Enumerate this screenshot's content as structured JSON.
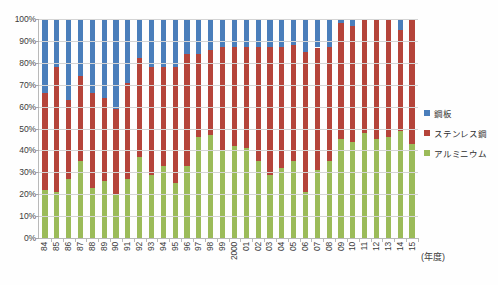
{
  "chart_data": {
    "type": "bar",
    "subtype": "100% stacked column",
    "title": "",
    "xlabel": "(年度)",
    "ylabel": "",
    "ylim": [
      0,
      100
    ],
    "ytick_labels": [
      "100%",
      "90%",
      "80%",
      "70%",
      "60%",
      "50%",
      "40%",
      "30%",
      "20%",
      "10%",
      "0%"
    ],
    "ytick_values": [
      100,
      90,
      80,
      70,
      60,
      50,
      40,
      30,
      20,
      10,
      0
    ],
    "grid": true,
    "legend_position": "right",
    "categories": [
      "84",
      "85",
      "86",
      "87",
      "88",
      "89",
      "90",
      "91",
      "92",
      "93",
      "94",
      "95",
      "96",
      "97",
      "98",
      "99",
      "2000",
      "01",
      "02",
      "03",
      "04",
      "05",
      "06",
      "07",
      "08",
      "09",
      "10",
      "11",
      "12",
      "13",
      "14",
      "15"
    ],
    "series": [
      {
        "name": "アルミニウム",
        "color": "#9BBB59",
        "values": [
          22,
          21,
          27,
          35,
          23,
          26,
          20,
          27,
          37,
          29,
          33,
          25,
          33,
          46,
          47,
          40,
          42,
          41,
          35,
          29,
          32,
          35,
          21,
          31,
          35,
          45,
          44,
          48,
          45,
          46,
          49,
          43
        ]
      },
      {
        "name": "ステンレス鋼",
        "color": "#B5443A",
        "values": [
          44,
          57,
          36,
          39,
          43,
          38,
          39,
          44,
          45,
          49,
          45,
          53,
          51,
          38,
          39,
          47,
          45,
          46,
          52,
          58,
          55,
          53,
          64,
          56,
          52,
          53,
          53,
          52,
          55,
          54,
          46,
          57
        ]
      },
      {
        "name": "鋼板",
        "color": "#4A7EBB",
        "values": [
          34,
          22,
          37,
          26,
          34,
          36,
          41,
          29,
          18,
          22,
          22,
          22,
          16,
          16,
          14,
          13,
          13,
          13,
          13,
          13,
          13,
          12,
          15,
          13,
          13,
          2,
          3,
          0,
          0,
          0,
          5,
          0
        ]
      }
    ],
    "stack_tops_alum": [
      22,
      21,
      27,
      35,
      23,
      26,
      20,
      27,
      37,
      29,
      33,
      25,
      33,
      46,
      47,
      40,
      42,
      41,
      35,
      29,
      32,
      35,
      21,
      31,
      35,
      45,
      44,
      48,
      45,
      46,
      49,
      43
    ],
    "stack_tops_stainless": [
      66,
      78,
      63,
      74,
      66,
      64,
      59,
      71,
      82,
      78,
      78,
      78,
      84,
      84,
      86,
      87,
      87,
      87,
      87,
      87,
      87,
      88,
      85,
      87,
      87,
      98,
      97,
      100,
      100,
      100,
      95,
      100
    ]
  },
  "legend": {
    "items": [
      {
        "label": "鋼板",
        "color": "#4A7EBB"
      },
      {
        "label": "ステンレス鋼",
        "color": "#B5443A"
      },
      {
        "label": "アルミニウム",
        "color": "#9BBB59"
      }
    ]
  }
}
